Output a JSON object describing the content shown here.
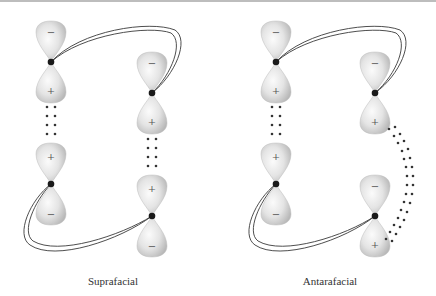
{
  "figure": {
    "panels": [
      {
        "caption": "Suprafacial",
        "orbitals": [
          {
            "id": "A",
            "x": 51,
            "y": 62,
            "top_sign": "−",
            "bottom_sign": "+"
          },
          {
            "id": "B",
            "x": 152,
            "y": 93,
            "top_sign": "−",
            "bottom_sign": "+"
          },
          {
            "id": "C",
            "x": 51,
            "y": 184,
            "top_sign": "+",
            "bottom_sign": "−"
          },
          {
            "id": "D",
            "x": 152,
            "y": 216,
            "top_sign": "+",
            "bottom_sign": "−"
          }
        ],
        "interaction": "dotted overlap A(+) to C(+) and B(+) to D(+), both on same face"
      },
      {
        "caption": "Antarafacial",
        "orbitals": [
          {
            "id": "A",
            "x": 276,
            "y": 62,
            "top_sign": "−",
            "bottom_sign": "+"
          },
          {
            "id": "B",
            "x": 375,
            "y": 93,
            "top_sign": "−",
            "bottom_sign": "+"
          },
          {
            "id": "C",
            "x": 276,
            "y": 184,
            "top_sign": "+",
            "bottom_sign": "−"
          },
          {
            "id": "D",
            "x": 375,
            "y": 216,
            "top_sign": "−",
            "bottom_sign": "+"
          }
        ],
        "interaction": "dotted overlap A(+) to C(+) same face; B(+) to D(+) across opposite faces via curved path"
      }
    ],
    "colors": {
      "lobe_fill": "#d9d9d9",
      "lobe_highlight": "#f7f7f7",
      "nucleus": "#1a1a1a",
      "bond_line": "#333333",
      "dots": "#333333",
      "border": "#bdbdbd"
    }
  },
  "labels": {
    "left": "Suprafacial",
    "right": "Antarafacial",
    "sign_plus": "+",
    "sign_minus": "−"
  }
}
